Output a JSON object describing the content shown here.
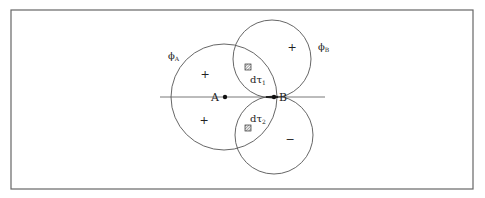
{
  "colors": {
    "line": "#555555",
    "frame": "#666666",
    "text": "#222222",
    "background": "#ffffff"
  },
  "frame": {
    "x": 11,
    "y": 10,
    "width": 462,
    "height": 179
  },
  "axis": {
    "x1": 160,
    "x2": 325,
    "y": 97
  },
  "orbitals": [
    {
      "id": "phi_A",
      "label": "ϕ",
      "subscript": "A",
      "cx": 224,
      "cy": 97,
      "r": 53,
      "label_x": 168,
      "label_y": 59
    },
    {
      "id": "phi_B_upper",
      "label": "ϕ",
      "subscript": "B",
      "cx": 272,
      "cy": 59,
      "r": 39,
      "label_x": 318,
      "label_y": 50
    },
    {
      "id": "phi_B_lower",
      "cx": 274,
      "cy": 135,
      "r": 39
    }
  ],
  "nuclei": [
    {
      "label": "A",
      "x": 225,
      "y": 97,
      "label_x": 211,
      "label_y": 101
    },
    {
      "label": "B",
      "x": 274,
      "y": 97,
      "label_x": 279,
      "label_y": 101
    }
  ],
  "signs": [
    {
      "symbol": "+",
      "x": 205,
      "y": 78
    },
    {
      "symbol": "+",
      "x": 292,
      "y": 51
    },
    {
      "symbol": "+",
      "x": 204,
      "y": 124
    },
    {
      "symbol": "−",
      "x": 290,
      "y": 143
    }
  ],
  "volume_elements": [
    {
      "label": "dτ",
      "subscript": "1",
      "box_x": 245,
      "box_y": 64,
      "label_x": 250,
      "label_y": 83
    },
    {
      "label": "dτ",
      "subscript": "2",
      "box_x": 245,
      "box_y": 125,
      "label_x": 250,
      "label_y": 122
    }
  ]
}
